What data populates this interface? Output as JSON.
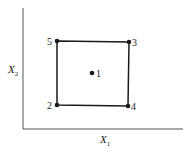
{
  "diagram": {
    "type": "design-points-square",
    "axes": {
      "x_label": "X",
      "x_subscript": "1",
      "y_label": "X",
      "y_subscript": "2",
      "color": "#555555"
    },
    "square": {
      "corners_order": [
        "5",
        "3",
        "4",
        "2"
      ],
      "color": "#1a1a1a"
    },
    "points": [
      {
        "id": "1",
        "label": "1",
        "position": "center"
      },
      {
        "id": "2",
        "label": "2",
        "position": "bottom-left"
      },
      {
        "id": "3",
        "label": "3",
        "position": "top-right"
      },
      {
        "id": "4",
        "label": "4",
        "position": "bottom-right"
      },
      {
        "id": "5",
        "label": "5",
        "position": "top-left"
      }
    ],
    "point_color": "#1a1a1a"
  }
}
